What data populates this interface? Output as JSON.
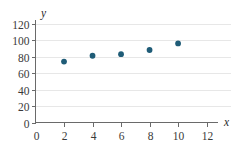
{
  "chart_data": {
    "type": "scatter",
    "title": "",
    "xlabel": "x",
    "ylabel": "y",
    "xlim": [
      0,
      12.8
    ],
    "ylim": [
      0,
      122
    ],
    "xticks": [
      0,
      2,
      4,
      6,
      8,
      10,
      12
    ],
    "yticks": [
      0,
      20,
      40,
      60,
      80,
      100,
      120
    ],
    "xtick_labels": [
      "0",
      "2",
      "4",
      "6",
      "8",
      "10",
      "12"
    ],
    "ytick_labels": [
      "0",
      "20",
      "40",
      "60",
      "80",
      "100",
      "120"
    ],
    "grid": true,
    "grid_axis": "y",
    "legend": false,
    "series": [
      {
        "name": "data",
        "marker": "circle",
        "color": "#1f5c77",
        "points": [
          {
            "x": 2,
            "y": 74
          },
          {
            "x": 4,
            "y": 81
          },
          {
            "x": 6,
            "y": 83
          },
          {
            "x": 8,
            "y": 88
          },
          {
            "x": 10,
            "y": 96
          }
        ]
      }
    ]
  },
  "colors": {
    "point": "#1f5c77",
    "grid": "#e7e7e7",
    "axis": "#6a6a6a",
    "text": "#3a3a3a",
    "background": "#ffffff"
  },
  "axes": {
    "x_axis_label": "x",
    "y_axis_label": "y"
  }
}
